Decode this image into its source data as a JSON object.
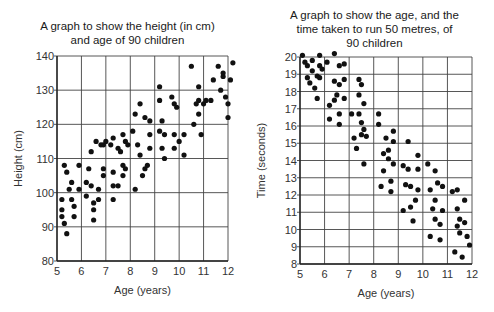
{
  "chart_data": [
    {
      "type": "scatter",
      "title": "A graph to show the height (in cm) and age of 90 children",
      "title_lines": [
        "A graph to show the height (in cm)",
        "and age of 90 children"
      ],
      "xlabel": "Age (years)",
      "ylabel": "Height (cm)",
      "xlim": [
        5,
        12
      ],
      "ylim": [
        80,
        140
      ],
      "xticks": [
        5,
        6,
        7,
        8,
        9,
        10,
        11,
        12
      ],
      "yticks": [
        80,
        90,
        100,
        110,
        120,
        130,
        140
      ],
      "grid": true,
      "points": [
        [
          5.2,
          98
        ],
        [
          5.2,
          95
        ],
        [
          5.2,
          93
        ],
        [
          5.3,
          91
        ],
        [
          5.4,
          88
        ],
        [
          5.3,
          108
        ],
        [
          5.4,
          106
        ],
        [
          5.6,
          103
        ],
        [
          5.5,
          101
        ],
        [
          5.6,
          98
        ],
        [
          5.7,
          96
        ],
        [
          5.7,
          93
        ],
        [
          5.9,
          108
        ],
        [
          5.9,
          101
        ],
        [
          6.2,
          99
        ],
        [
          6.2,
          103
        ],
        [
          6.3,
          107
        ],
        [
          6.4,
          102
        ],
        [
          6.4,
          112
        ],
        [
          6.6,
          115
        ],
        [
          6.5,
          97
        ],
        [
          6.5,
          95
        ],
        [
          6.5,
          92
        ],
        [
          6.7,
          101
        ],
        [
          6.7,
          98
        ],
        [
          6.9,
          107
        ],
        [
          6.9,
          105
        ],
        [
          6.9,
          114
        ],
        [
          7.3,
          102
        ],
        [
          7.3,
          106
        ],
        [
          7.3,
          98
        ],
        [
          7.5,
          102
        ],
        [
          7.5,
          113
        ],
        [
          7.6,
          112
        ],
        [
          7.7,
          117
        ],
        [
          7.7,
          108
        ],
        [
          7.7,
          105
        ],
        [
          7.8,
          115
        ],
        [
          7.8,
          107
        ],
        [
          7.9,
          114
        ],
        [
          7.3,
          116
        ],
        [
          7.2,
          114
        ],
        [
          7.0,
          115
        ],
        [
          6.8,
          114
        ],
        [
          8.2,
          101
        ],
        [
          8.4,
          111
        ],
        [
          8.5,
          105
        ],
        [
          8.6,
          107
        ],
        [
          8.7,
          108
        ],
        [
          8.8,
          113
        ],
        [
          8.1,
          118
        ],
        [
          8.2,
          123
        ],
        [
          8.4,
          126
        ],
        [
          8.6,
          122
        ],
        [
          8.8,
          121
        ],
        [
          8.3,
          114
        ],
        [
          8.8,
          117
        ],
        [
          9.2,
          131
        ],
        [
          9.2,
          127
        ],
        [
          9.3,
          121
        ],
        [
          9.2,
          118
        ],
        [
          9.3,
          113
        ],
        [
          9.4,
          117
        ],
        [
          9.4,
          110
        ],
        [
          9.7,
          128
        ],
        [
          9.8,
          126
        ],
        [
          9.9,
          125
        ],
        [
          9.8,
          117
        ],
        [
          9.8,
          113
        ],
        [
          10.0,
          115
        ],
        [
          10.2,
          111
        ],
        [
          10.2,
          117
        ],
        [
          10.5,
          137
        ],
        [
          10.6,
          120
        ],
        [
          10.7,
          126
        ],
        [
          10.8,
          123
        ],
        [
          10.8,
          131
        ],
        [
          10.8,
          127
        ],
        [
          11.0,
          126
        ],
        [
          11.1,
          127
        ],
        [
          10.9,
          117
        ],
        [
          11.3,
          127
        ],
        [
          11.4,
          133
        ],
        [
          11.6,
          137
        ],
        [
          11.7,
          130
        ],
        [
          11.8,
          135
        ],
        [
          11.8,
          134
        ],
        [
          11.9,
          128
        ],
        [
          12.0,
          126
        ],
        [
          12.1,
          133
        ],
        [
          12.2,
          138
        ],
        [
          12.0,
          122
        ]
      ]
    },
    {
      "type": "scatter",
      "title": "A graph to show the age, and the time taken to run 50 metres, of 90 children",
      "title_lines": [
        "A graph to show the age, and the",
        "time taken to run 50 metres, of",
        "90 children"
      ],
      "xlabel": "Age (years)",
      "ylabel": "Time (seconds)",
      "xlim": [
        5,
        12
      ],
      "ylim": [
        8,
        20
      ],
      "xticks": [
        5,
        6,
        7,
        8,
        9,
        10,
        11,
        12
      ],
      "yticks": [
        8,
        9,
        10,
        11,
        12,
        13,
        14,
        15,
        16,
        17,
        18,
        19,
        20
      ],
      "grid": true,
      "points": [
        [
          5.1,
          20.1
        ],
        [
          5.2,
          19.7
        ],
        [
          5.3,
          19.5
        ],
        [
          5.5,
          19.8
        ],
        [
          5.5,
          19.2
        ],
        [
          5.3,
          18.8
        ],
        [
          5.4,
          18.5
        ],
        [
          5.6,
          18.2
        ],
        [
          5.7,
          18.9
        ],
        [
          5.8,
          18.8
        ],
        [
          5.8,
          19.5
        ],
        [
          5.8,
          20.1
        ],
        [
          5.9,
          19.3
        ],
        [
          6.1,
          19.7
        ],
        [
          5.7,
          17.6
        ],
        [
          6.4,
          20.2
        ],
        [
          6.6,
          19.5
        ],
        [
          6.8,
          19.6
        ],
        [
          6.4,
          18.6
        ],
        [
          6.6,
          18.4
        ],
        [
          6.8,
          18.7
        ],
        [
          6.5,
          17.8
        ],
        [
          6.4,
          17.5
        ],
        [
          6.8,
          17.6
        ],
        [
          6.2,
          17.2
        ],
        [
          6.2,
          16.4
        ],
        [
          6.6,
          16.7
        ],
        [
          6.6,
          16.1
        ],
        [
          7.1,
          16.7
        ],
        [
          7.4,
          16.7
        ],
        [
          7.4,
          18.7
        ],
        [
          7.5,
          18.4
        ],
        [
          7.4,
          17.8
        ],
        [
          7.6,
          17.3
        ],
        [
          7.5,
          16.2
        ],
        [
          7.6,
          15.8
        ],
        [
          7.5,
          15.5
        ],
        [
          7.7,
          15.4
        ],
        [
          7.2,
          15.3
        ],
        [
          7.3,
          14.7
        ],
        [
          7.6,
          13.8
        ],
        [
          8.2,
          16.7
        ],
        [
          8.2,
          16.1
        ],
        [
          8.8,
          15.7
        ],
        [
          8.5,
          15.3
        ],
        [
          8.8,
          15.1
        ],
        [
          9.4,
          15.1
        ],
        [
          8.4,
          14.4
        ],
        [
          8.6,
          14.6
        ],
        [
          8.6,
          14.1
        ],
        [
          8.8,
          13.8
        ],
        [
          8.4,
          13.4
        ],
        [
          8.3,
          12.5
        ],
        [
          8.7,
          12.8
        ],
        [
          8.7,
          12.2
        ],
        [
          9.2,
          13.7
        ],
        [
          9.4,
          13.5
        ],
        [
          9.8,
          14.3
        ],
        [
          9.8,
          13.5
        ],
        [
          9.3,
          12.6
        ],
        [
          9.5,
          12.5
        ],
        [
          9.8,
          12.3
        ],
        [
          9.7,
          11.7
        ],
        [
          9.5,
          11.3
        ],
        [
          9.2,
          11.1
        ],
        [
          9.6,
          10.5
        ],
        [
          10.2,
          13.8
        ],
        [
          10.5,
          13.4
        ],
        [
          10.3,
          12.3
        ],
        [
          10.6,
          12.7
        ],
        [
          10.8,
          12.5
        ],
        [
          10.5,
          11.7
        ],
        [
          10.4,
          11.2
        ],
        [
          10.8,
          11.1
        ],
        [
          10.5,
          10.6
        ],
        [
          10.7,
          10.3
        ],
        [
          10.3,
          9.6
        ],
        [
          10.7,
          9.4
        ],
        [
          11.2,
          12.2
        ],
        [
          11.4,
          12.3
        ],
        [
          11.7,
          11.7
        ],
        [
          11.4,
          11.2
        ],
        [
          11.5,
          10.6
        ],
        [
          11.7,
          10.4
        ],
        [
          11.4,
          10.2
        ],
        [
          11.5,
          9.8
        ],
        [
          11.8,
          9.6
        ],
        [
          11.9,
          9.1
        ],
        [
          11.3,
          8.7
        ],
        [
          11.6,
          8.4
        ]
      ]
    }
  ]
}
